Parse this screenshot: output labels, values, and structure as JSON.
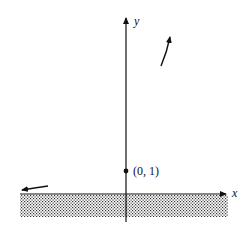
{
  "diagram": {
    "type": "graph-sketch",
    "axes": {
      "x_label": "x",
      "y_label": "y"
    },
    "point": {
      "label": "(0, 1)",
      "x": 0,
      "y": 1
    },
    "shaded_region": "below x-axis (y < 0)",
    "arrows": [
      {
        "position": "upper-right",
        "direction": "up-right"
      },
      {
        "position": "lower-left near x-axis",
        "direction": "left"
      }
    ],
    "colors": {
      "ink": "#111111",
      "background": "#ffffff"
    }
  }
}
